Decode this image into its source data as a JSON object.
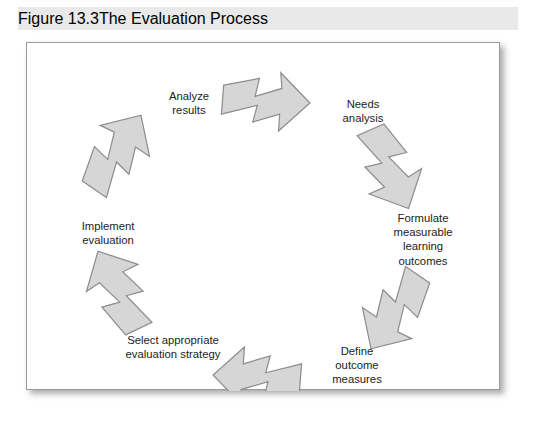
{
  "caption": {
    "figure_number": "Figure 13.3",
    "title": "The Evaluation Process"
  },
  "figure": {
    "background_color": "#ffffff",
    "border_color": "#9a9a9a",
    "banner_color": "#e9e9e9"
  },
  "diagram": {
    "type": "cycle",
    "direction": "clockwise",
    "arrow_fill": "#d6d6d6",
    "arrow_stroke": "#8d8d8d",
    "arrow_count": 6,
    "steps": [
      {
        "id": "needs-analysis",
        "label": "Needs\nanalysis"
      },
      {
        "id": "formulate-outcomes",
        "label": "Formulate\nmeasurable learning\noutcomes"
      },
      {
        "id": "define-measures",
        "label": "Define\noutcome\nmeasures"
      },
      {
        "id": "select-strategy",
        "label": "Select appropriate\nevaluation strategy"
      },
      {
        "id": "implement-evaluation",
        "label": "Implement\nevaluation"
      },
      {
        "id": "analyze-results",
        "label": "Analyze\nresults"
      }
    ],
    "arrows": [
      {
        "id": "arrow-to-needs-analysis",
        "angle_deg": 0
      },
      {
        "id": "arrow-to-formulate-outcomes",
        "angle_deg": 60
      },
      {
        "id": "arrow-to-define-measures",
        "angle_deg": 120
      },
      {
        "id": "arrow-to-select-strategy",
        "angle_deg": 180
      },
      {
        "id": "arrow-to-implement-evaluation",
        "angle_deg": 240
      },
      {
        "id": "arrow-to-analyze-results",
        "angle_deg": 300
      }
    ]
  }
}
